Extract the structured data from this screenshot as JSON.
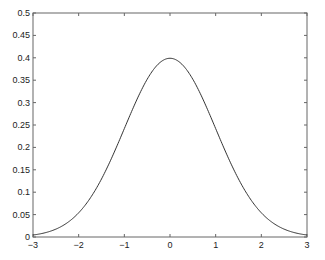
{
  "chart_data": {
    "type": "line",
    "title": "",
    "xlabel": "",
    "ylabel": "",
    "xlim": [
      -3,
      3
    ],
    "ylim": [
      0,
      0.5
    ],
    "grid": false,
    "legend": null,
    "x_ticks": [
      "-3",
      "-2",
      "-1",
      "0",
      "1",
      "2",
      "3"
    ],
    "y_ticks": [
      "0",
      "0.05",
      "0.1",
      "0.15",
      "0.2",
      "0.25",
      "0.3",
      "0.35",
      "0.4",
      "0.45",
      "0.5"
    ],
    "series": [
      {
        "name": "standard normal pdf",
        "color": "#333333",
        "function": "exp(-x^2/2)/sqrt(2*pi)",
        "x": [
          -3,
          -2.5,
          -2,
          -1.5,
          -1,
          -0.5,
          0,
          0.5,
          1,
          1.5,
          2,
          2.5,
          3
        ],
        "y": [
          0.0044,
          0.0175,
          0.054,
          0.1295,
          0.242,
          0.3521,
          0.3989,
          0.3521,
          0.242,
          0.1295,
          0.054,
          0.0175,
          0.0044
        ]
      }
    ]
  },
  "plot": {
    "axes_color": "#555555",
    "line_color": "#333333"
  }
}
